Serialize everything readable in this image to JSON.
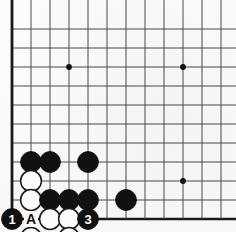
{
  "diagram": {
    "kind": "go-board-diagram",
    "board": {
      "columns": 12,
      "rows": 11,
      "cell": 19,
      "origin_x": 12,
      "origin_y": 0,
      "bottom_y": 219,
      "left_edge_col": 0,
      "bottom_edge_row": 10,
      "line_color": "#4a4a4a",
      "edge_color": "#1a1a1a",
      "background_color": "#fbfbf9"
    },
    "star_points": [
      {
        "col": 3,
        "row": 2,
        "name": "hoshi-upper-left"
      },
      {
        "col": 9,
        "row": 2,
        "name": "hoshi-upper-right"
      },
      {
        "col": 9,
        "row": 8,
        "name": "hoshi-lower-right"
      }
    ],
    "stone_colors": {
      "black": "#111111",
      "white": "#fefefe",
      "white_outline": "#1a1a1a",
      "black_label": "#ffffff",
      "white_label": "#111111"
    },
    "stones": [
      {
        "id": "b-c1-r7",
        "col": 1,
        "row": 7,
        "color": "black",
        "label": "",
        "name": "black-stone"
      },
      {
        "id": "b-c2-r7",
        "col": 2,
        "row": 7,
        "color": "black",
        "label": "",
        "name": "black-stone"
      },
      {
        "id": "b-c4-r7",
        "col": 4,
        "row": 7,
        "color": "black",
        "label": "",
        "name": "black-stone"
      },
      {
        "id": "w-c1-r8",
        "col": 1,
        "row": 8,
        "color": "white",
        "label": "",
        "name": "white-stone"
      },
      {
        "id": "w-c1-r9",
        "col": 1,
        "row": 9,
        "color": "white",
        "label": "",
        "name": "white-stone"
      },
      {
        "id": "b-c2-r9",
        "col": 2,
        "row": 9,
        "color": "black",
        "label": "",
        "name": "black-stone"
      },
      {
        "id": "b-c3-r9",
        "col": 3,
        "row": 9,
        "color": "black",
        "label": "",
        "name": "black-stone"
      },
      {
        "id": "b-c4-r9",
        "col": 4,
        "row": 9,
        "color": "black",
        "label": "",
        "name": "black-stone"
      },
      {
        "id": "b-c6-r9",
        "col": 6,
        "row": 9,
        "color": "black",
        "label": "",
        "name": "black-stone"
      },
      {
        "id": "b-c0-r10-move1",
        "col": 0,
        "row": 10,
        "color": "black",
        "label": "1",
        "name": "black-stone-move-1"
      },
      {
        "id": "w-c2-r10",
        "col": 2,
        "row": 10,
        "color": "white",
        "label": "",
        "name": "white-stone"
      },
      {
        "id": "w-c3-r10",
        "col": 3,
        "row": 10,
        "color": "white",
        "label": "",
        "name": "white-stone"
      },
      {
        "id": "b-c4-r10-move3",
        "col": 4,
        "row": 10,
        "color": "black",
        "label": "3",
        "name": "black-stone-move-3"
      },
      {
        "id": "w-c1-r11-move2",
        "col": 1,
        "row": 11,
        "color": "white",
        "label": "2",
        "name": "white-stone-move-2"
      },
      {
        "id": "w-c3-r11-move4",
        "col": 3,
        "row": 11,
        "color": "white",
        "label": "4",
        "name": "white-stone-move-4"
      }
    ],
    "point_labels": [
      {
        "id": "label-A",
        "col": 1,
        "row": 10,
        "text": "A",
        "name": "board-point-label-a"
      }
    ],
    "move_sequence": [
      "1",
      "2",
      "3",
      "4"
    ],
    "marked_point": "A"
  }
}
